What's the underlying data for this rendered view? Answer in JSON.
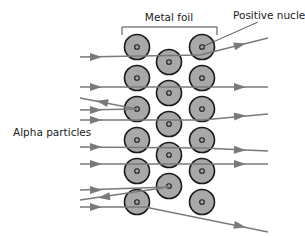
{
  "labels": {
    "foil": "Metal foil",
    "nucleus": "Positive nucleus",
    "particles": "Alpha particles"
  },
  "colors": {
    "atom_fill": "#a8a8a8",
    "atom_stroke": "#1a1a1a",
    "path": "#7a7a7a"
  },
  "atoms": [
    {
      "col": 1,
      "row": 0
    },
    {
      "col": 1,
      "row": 1
    },
    {
      "col": 1,
      "row": 2
    },
    {
      "col": 1,
      "row": 3
    },
    {
      "col": 1,
      "row": 4
    },
    {
      "col": 1,
      "row": 5
    },
    {
      "col": 2,
      "row": 0
    },
    {
      "col": 2,
      "row": 1
    },
    {
      "col": 2,
      "row": 2
    },
    {
      "col": 2,
      "row": 3
    },
    {
      "col": 2,
      "row": 4
    },
    {
      "col": 3,
      "row": 0
    },
    {
      "col": 3,
      "row": 1
    },
    {
      "col": 3,
      "row": 2
    },
    {
      "col": 3,
      "row": 3
    },
    {
      "col": 3,
      "row": 4
    },
    {
      "col": 3,
      "row": 5
    }
  ],
  "paths": [
    {
      "kind": "deflected-small",
      "description": "passes near top-right nucleus, deflected upward"
    },
    {
      "kind": "straight"
    },
    {
      "kind": "reflected",
      "description": "bounces back from nucleus"
    },
    {
      "kind": "incoming-to-reflect"
    },
    {
      "kind": "deflected-small"
    },
    {
      "kind": "straight"
    },
    {
      "kind": "straight"
    },
    {
      "kind": "incoming-to-reflect"
    },
    {
      "kind": "reflected"
    },
    {
      "kind": "deflected-small",
      "description": "deflected downward"
    }
  ]
}
